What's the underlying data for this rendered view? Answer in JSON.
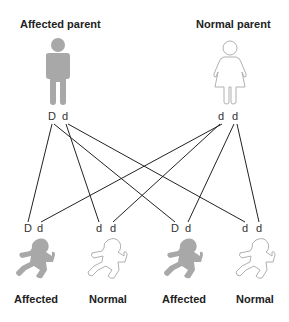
{
  "parents": [
    {
      "label": "Affected parent",
      "alleles": [
        "D",
        "d"
      ],
      "figure": "male-figure-icon",
      "affected": true
    },
    {
      "label": "Normal parent",
      "alleles": [
        "d",
        "d"
      ],
      "figure": "female-figure-icon",
      "affected": false
    }
  ],
  "children": [
    {
      "label": "Affected",
      "alleles": [
        "D",
        "d"
      ],
      "affected": true
    },
    {
      "label": "Normal",
      "alleles": [
        "d",
        "d"
      ],
      "affected": false
    },
    {
      "label": "Affected",
      "alleles": [
        "D",
        "d"
      ],
      "affected": true
    },
    {
      "label": "Normal",
      "alleles": [
        "d",
        "d"
      ],
      "affected": false
    }
  ],
  "colors": {
    "affected_fill": "#a8a8a8",
    "normal_stroke": "#b0b0b0",
    "line": "#222222"
  }
}
